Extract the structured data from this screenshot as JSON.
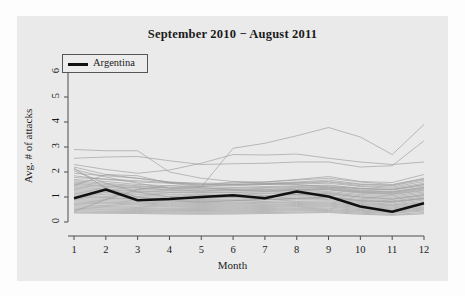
{
  "chart_data": {
    "type": "line",
    "title": "September 2010 − August 2011",
    "xlabel": "Month",
    "ylabel": "Avg. # of attacks",
    "xlim": [
      1,
      12
    ],
    "ylim": [
      0,
      6.4
    ],
    "grid": false,
    "legend_position": "top-left",
    "xticks": [
      "1",
      "2",
      "3",
      "4",
      "5",
      "6",
      "7",
      "8",
      "9",
      "10",
      "11",
      "12"
    ],
    "yticks": [
      "0",
      "1",
      "2",
      "3",
      "4",
      "5",
      "6"
    ],
    "x": [
      1,
      2,
      3,
      4,
      5,
      6,
      7,
      8,
      9,
      10,
      11,
      12
    ],
    "highlight_color": "#111111",
    "background_color": "#eaeaea",
    "other_series_color": "#9a9a9a",
    "legend": [
      {
        "name": "Argentina",
        "color": "#111111",
        "width": 2.6
      }
    ],
    "series": [
      {
        "name": "Argentina",
        "highlight": true,
        "values": [
          0.95,
          1.3,
          0.87,
          0.92,
          1.0,
          1.07,
          0.95,
          1.22,
          1.02,
          0.62,
          0.41,
          0.75
        ]
      },
      {
        "name": "country-01",
        "highlight": false,
        "values": [
          2.9,
          2.85,
          2.85,
          2.0,
          1.75,
          1.62,
          1.6,
          1.7,
          1.82,
          1.62,
          1.58,
          1.9
        ]
      },
      {
        "name": "country-02",
        "highlight": false,
        "values": [
          2.55,
          2.6,
          2.62,
          2.45,
          2.3,
          2.33,
          2.35,
          2.4,
          2.4,
          2.2,
          2.25,
          3.25
        ]
      },
      {
        "name": "country-03",
        "highlight": false,
        "values": [
          2.3,
          2.1,
          1.95,
          2.08,
          2.35,
          2.7,
          2.68,
          2.72,
          2.55,
          2.4,
          2.3,
          2.4
        ]
      },
      {
        "name": "country-04",
        "highlight": false,
        "values": [
          2.2,
          1.9,
          1.75,
          1.6,
          1.45,
          1.6,
          1.55,
          1.5,
          1.4,
          1.35,
          1.3,
          1.5
        ]
      },
      {
        "name": "country-05",
        "highlight": false,
        "values": [
          2.1,
          1.8,
          1.55,
          1.35,
          1.4,
          2.95,
          3.15,
          3.45,
          3.78,
          3.4,
          2.7,
          3.9
        ]
      },
      {
        "name": "country-06",
        "highlight": false,
        "values": [
          1.95,
          1.85,
          1.75,
          1.6,
          1.55,
          1.55,
          1.6,
          1.68,
          1.75,
          1.6,
          1.5,
          1.75
        ]
      },
      {
        "name": "country-07",
        "highlight": false,
        "values": [
          1.85,
          1.7,
          1.6,
          1.55,
          1.5,
          1.48,
          1.5,
          1.55,
          1.6,
          1.45,
          1.4,
          1.62
        ]
      },
      {
        "name": "country-08",
        "highlight": false,
        "values": [
          1.78,
          1.72,
          1.65,
          1.58,
          1.52,
          1.5,
          1.52,
          1.58,
          1.62,
          1.5,
          1.45,
          1.68
        ]
      },
      {
        "name": "country-09",
        "highlight": false,
        "values": [
          1.7,
          1.62,
          1.5,
          1.45,
          1.42,
          1.45,
          1.5,
          1.52,
          1.55,
          1.42,
          1.35,
          1.55
        ]
      },
      {
        "name": "country-10",
        "highlight": false,
        "values": [
          1.65,
          1.55,
          1.45,
          1.38,
          1.35,
          1.38,
          1.42,
          1.45,
          1.48,
          1.35,
          1.3,
          1.5
        ]
      },
      {
        "name": "country-11",
        "highlight": false,
        "values": [
          1.6,
          1.5,
          1.42,
          1.35,
          1.32,
          1.35,
          1.38,
          1.42,
          1.45,
          1.32,
          1.28,
          1.45
        ]
      },
      {
        "name": "country-12",
        "highlight": false,
        "values": [
          1.55,
          1.45,
          1.38,
          1.3,
          1.28,
          1.3,
          1.35,
          1.38,
          1.4,
          1.28,
          1.22,
          1.4
        ]
      },
      {
        "name": "country-13",
        "highlight": false,
        "values": [
          1.5,
          1.42,
          1.35,
          1.28,
          1.25,
          1.28,
          1.3,
          1.35,
          1.38,
          1.25,
          1.2,
          1.38
        ]
      },
      {
        "name": "country-14",
        "highlight": false,
        "values": [
          1.45,
          1.38,
          1.3,
          1.25,
          1.22,
          1.25,
          1.28,
          1.3,
          1.32,
          1.2,
          1.15,
          1.32
        ]
      },
      {
        "name": "country-15",
        "highlight": false,
        "values": [
          1.4,
          1.32,
          1.25,
          1.2,
          1.18,
          1.2,
          1.22,
          1.28,
          1.3,
          1.18,
          1.12,
          1.28
        ]
      },
      {
        "name": "country-16",
        "highlight": false,
        "values": [
          1.35,
          1.28,
          1.22,
          1.18,
          1.15,
          1.18,
          1.2,
          1.25,
          1.28,
          1.15,
          1.1,
          1.25
        ]
      },
      {
        "name": "country-17",
        "highlight": false,
        "values": [
          1.3,
          1.22,
          1.18,
          1.12,
          1.1,
          1.12,
          1.15,
          1.2,
          1.22,
          1.1,
          1.05,
          1.2
        ]
      },
      {
        "name": "country-18",
        "highlight": false,
        "values": [
          1.25,
          1.18,
          1.12,
          1.08,
          1.05,
          1.08,
          1.12,
          1.15,
          1.18,
          1.05,
          1.0,
          1.15
        ]
      },
      {
        "name": "country-19",
        "highlight": false,
        "values": [
          1.2,
          1.12,
          1.08,
          1.02,
          1.0,
          1.02,
          1.05,
          1.1,
          1.12,
          1.0,
          0.95,
          1.1
        ]
      },
      {
        "name": "country-20",
        "highlight": false,
        "values": [
          1.15,
          1.08,
          1.02,
          0.98,
          0.95,
          0.98,
          1.0,
          1.05,
          1.08,
          0.95,
          0.9,
          1.05
        ]
      },
      {
        "name": "country-21",
        "highlight": false,
        "values": [
          1.1,
          1.02,
          0.98,
          0.92,
          0.9,
          0.92,
          0.95,
          1.0,
          1.02,
          0.9,
          0.85,
          1.0
        ]
      },
      {
        "name": "country-22",
        "highlight": false,
        "values": [
          1.05,
          0.98,
          0.92,
          0.88,
          0.86,
          0.88,
          0.9,
          0.95,
          0.98,
          0.86,
          0.82,
          0.95
        ]
      },
      {
        "name": "country-23",
        "highlight": false,
        "values": [
          1.0,
          0.95,
          0.9,
          0.85,
          0.82,
          0.85,
          0.88,
          0.92,
          0.95,
          0.82,
          0.78,
          0.92
        ]
      },
      {
        "name": "country-24",
        "highlight": false,
        "values": [
          0.95,
          0.9,
          0.85,
          0.8,
          0.78,
          0.8,
          0.82,
          0.88,
          0.9,
          0.78,
          0.72,
          0.88
        ]
      },
      {
        "name": "country-25",
        "highlight": false,
        "values": [
          0.9,
          0.85,
          0.8,
          0.76,
          0.74,
          0.76,
          0.78,
          0.82,
          0.85,
          0.74,
          0.68,
          0.82
        ]
      },
      {
        "name": "country-26",
        "highlight": false,
        "values": [
          0.85,
          0.8,
          0.76,
          0.72,
          0.7,
          0.72,
          0.75,
          0.78,
          0.8,
          0.7,
          0.65,
          0.78
        ]
      },
      {
        "name": "country-27",
        "highlight": false,
        "values": [
          0.8,
          0.76,
          0.72,
          0.68,
          0.66,
          0.68,
          0.7,
          0.74,
          0.76,
          0.66,
          0.6,
          0.74
        ]
      },
      {
        "name": "country-28",
        "highlight": false,
        "values": [
          0.75,
          0.72,
          0.68,
          0.64,
          0.62,
          0.64,
          0.66,
          0.7,
          0.72,
          0.62,
          0.56,
          0.7
        ]
      },
      {
        "name": "country-29",
        "highlight": false,
        "values": [
          0.7,
          0.66,
          0.63,
          0.6,
          0.58,
          0.6,
          0.62,
          0.66,
          0.68,
          0.58,
          0.52,
          0.65
        ]
      },
      {
        "name": "country-30",
        "highlight": false,
        "values": [
          0.65,
          0.62,
          0.58,
          0.55,
          0.54,
          0.56,
          0.58,
          0.62,
          0.64,
          0.54,
          0.48,
          0.6
        ]
      },
      {
        "name": "country-31",
        "highlight": false,
        "values": [
          0.6,
          0.57,
          0.54,
          0.51,
          0.5,
          0.52,
          0.54,
          0.57,
          0.6,
          0.5,
          0.45,
          0.56
        ]
      },
      {
        "name": "country-32",
        "highlight": false,
        "values": [
          0.55,
          0.52,
          0.5,
          0.47,
          0.46,
          0.48,
          0.5,
          0.53,
          0.55,
          0.46,
          0.42,
          0.52
        ]
      },
      {
        "name": "country-33",
        "highlight": false,
        "values": [
          0.5,
          0.48,
          0.46,
          0.44,
          0.43,
          0.44,
          0.46,
          0.49,
          0.5,
          0.43,
          0.38,
          0.48
        ]
      },
      {
        "name": "country-34",
        "highlight": false,
        "values": [
          0.45,
          0.43,
          0.42,
          0.4,
          0.39,
          0.4,
          0.42,
          0.45,
          0.46,
          0.39,
          0.35,
          0.44
        ]
      },
      {
        "name": "country-35",
        "highlight": false,
        "values": [
          0.4,
          0.39,
          0.38,
          0.36,
          0.35,
          0.36,
          0.38,
          0.4,
          0.42,
          0.35,
          0.3,
          0.38
        ]
      },
      {
        "name": "country-36",
        "highlight": false,
        "values": [
          0.36,
          0.35,
          0.34,
          0.32,
          0.31,
          0.32,
          0.34,
          0.36,
          0.38,
          0.31,
          0.27,
          0.33
        ]
      },
      {
        "name": "country-37",
        "highlight": false,
        "values": [
          2.15,
          1.35,
          1.0,
          0.85,
          0.8,
          0.85,
          0.9,
          0.95,
          1.0,
          0.85,
          0.8,
          0.95
        ]
      },
      {
        "name": "country-38",
        "highlight": false,
        "values": [
          2.05,
          1.55,
          1.2,
          1.0,
          0.95,
          1.0,
          1.05,
          1.1,
          1.15,
          1.0,
          0.92,
          1.08
        ]
      },
      {
        "name": "country-39",
        "highlight": false,
        "values": [
          1.45,
          1.9,
          1.85,
          1.55,
          1.42,
          1.5,
          1.55,
          1.6,
          1.68,
          1.52,
          1.48,
          1.72
        ]
      },
      {
        "name": "country-40",
        "highlight": false,
        "values": [
          0.42,
          0.9,
          1.3,
          1.45,
          1.38,
          1.28,
          1.25,
          1.3,
          1.35,
          1.22,
          1.18,
          1.35
        ]
      }
    ]
  },
  "legend": {
    "entry_label": "Argentina"
  },
  "axes": {
    "x_title": "Month",
    "y_title": "Avg. # of attacks"
  }
}
